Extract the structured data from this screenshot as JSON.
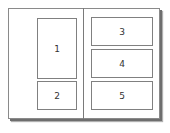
{
  "diagram": {
    "type": "page-layout",
    "panels": [
      {
        "label": "1",
        "column": "left"
      },
      {
        "label": "2",
        "column": "left"
      },
      {
        "label": "3",
        "column": "right"
      },
      {
        "label": "4",
        "column": "right"
      },
      {
        "label": "5",
        "column": "right"
      }
    ]
  }
}
